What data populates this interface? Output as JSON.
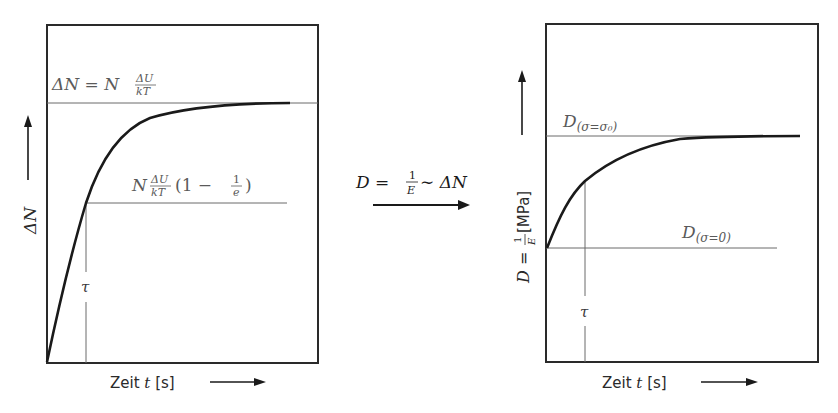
{
  "left_chart": {
    "y_axis_label": "ΔN",
    "x_axis_label_prefix": "Zeit ",
    "x_axis_label_var": "t",
    "x_axis_label_unit": " [s]",
    "asymptote_label": {
      "lhs": "ΔN = N",
      "frac_num": "ΔU",
      "frac_den": "kT"
    },
    "tau_level_label": {
      "lhs": "N",
      "frac_num": "ΔU",
      "frac_den": "kT",
      "paren": "(1 − ",
      "inner_num": "1",
      "inner_den": "e",
      "close": ")"
    },
    "tau_label": "τ"
  },
  "transition": {
    "lhs": "D = ",
    "frac_num": "1",
    "frac_den": "E",
    "rhs": " ∼ ΔN"
  },
  "right_chart": {
    "y_axis_label_lhs": "D = ",
    "y_axis_frac_num": "1",
    "y_axis_frac_den": "E",
    "y_axis_unit": " [MPa]",
    "x_axis_label_prefix": "Zeit ",
    "x_axis_label_var": "t",
    "x_axis_label_unit": " [s]",
    "upper_label_main": "D",
    "upper_label_sub": "(σ=σ₀)",
    "lower_label_main": "D",
    "lower_label_sub": "(σ=0)",
    "tau_label": "τ"
  },
  "colors": {
    "frame": "#2a2a2a",
    "curve": "#1a1a1a",
    "guide": "#6a6a6a",
    "label": "#5a5a5a"
  }
}
